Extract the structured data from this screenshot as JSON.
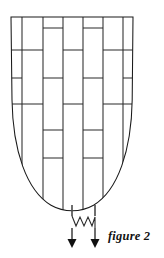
{
  "figure": {
    "caption": "figure 2",
    "title": "figure 2",
    "type": "line-diagram",
    "canvas": {
      "width": 164,
      "height": 258
    },
    "colors": {
      "background": "#ffffff",
      "outline_stroke": "#1a1a1a",
      "brick_stroke": "#2b2b2b",
      "stem_stroke": "#4a4a4a",
      "arrowhead_fill": "#111111",
      "caption_text": "#111111"
    },
    "outline": {
      "name": "bullet-outline",
      "top_y": 17,
      "bottom_y": 208,
      "left_x": 11,
      "right_x": 133,
      "path": "M 11 17 L 133 17 L 132 100 C 131 150 118 190 93 205 C 80 212 64 212 51 205 C 26 190 13 150 12 100 Z"
    },
    "vertical_lines": {
      "name": "brick-vertical-joints",
      "x_positions": [
        22,
        43,
        63,
        83,
        103,
        123
      ]
    },
    "horizontal_rows": {
      "name": "brick-course-lines",
      "y_positions": [
        17,
        40,
        62,
        84,
        106,
        128,
        150,
        172
      ]
    },
    "stems": {
      "name": "exit-stems",
      "x_positions": [
        72,
        95
      ],
      "top_y": 205,
      "bottom_y": 241
    },
    "zigzag": {
      "name": "break-symbol",
      "y_center": 222,
      "amplitude": 5
    },
    "arrowheads": {
      "name": "down-arrowheads",
      "count": 2,
      "y_tip": 247
    }
  }
}
